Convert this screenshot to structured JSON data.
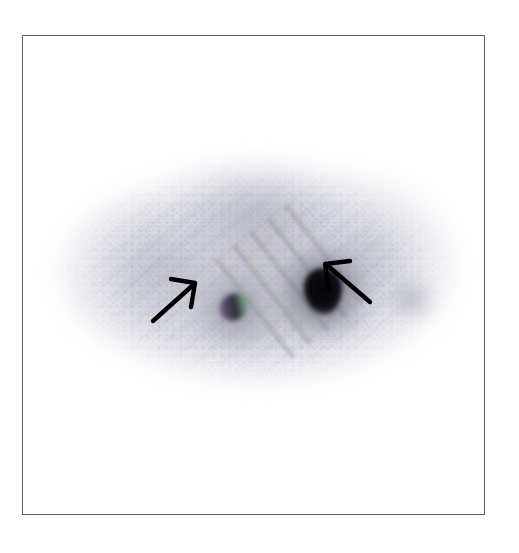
{
  "figure": {
    "domain": "medical-scintigraphy-scan",
    "modality_appearance": "grayscale planar nuclear-medicine / scintigraphic image",
    "background_color": "#ffffff",
    "frame": {
      "border_color": "#5e5e62",
      "border_width_px": 1,
      "x": 22,
      "y": 35,
      "width": 463,
      "height": 480
    },
    "caption": "",
    "title": "",
    "labels": []
  },
  "scan": {
    "field_shape": "horizontal ellipse",
    "field_bounds": {
      "x": 38,
      "y": 152,
      "width": 428,
      "height": 246
    },
    "tone_colors": {
      "background": "#ffffff",
      "faint_periphery": "#eceef3",
      "mid_uptake": "#d6d6de",
      "dense_uptake": "#bcbcc6",
      "darker_band": "#aeaeba",
      "lesion_core": "#07070b"
    },
    "texture": {
      "noise": "pixel grain",
      "striping": "diagonal acquisition stripes at about -38 degrees",
      "chromatic_fringing": "purple / green / olive diagonal bands near the centre"
    }
  },
  "findings": [
    {
      "id": "lesion-right",
      "name": "dense focal lesion (right)",
      "center": {
        "x": 300,
        "y": 255
      },
      "size_px": {
        "width": 38,
        "height": 46
      },
      "intensity": "very dark / near-black focus with graded halo",
      "annotated": true
    },
    {
      "id": "lesion-left",
      "name": "smaller focal lesion (left)",
      "center": {
        "x": 211,
        "y": 271
      },
      "size_px": {
        "width": 30,
        "height": 26
      },
      "intensity": "moderately dark focus with colour fringing",
      "annotated": true
    },
    {
      "id": "lesion-far-right",
      "name": "faint focus (far right)",
      "center": {
        "x": 388,
        "y": 263
      },
      "size_px": {
        "width": 52,
        "height": 42
      },
      "intensity": "faint low-contrast shading",
      "annotated": false
    }
  ],
  "annotations": {
    "arrow_color": "#000000",
    "arrow_line_width_px": 4,
    "arrows": [
      {
        "id": "arrow-left",
        "name": "arrow pointing to smaller left lesion",
        "tail": {
          "x": 152,
          "y": 320
        },
        "head": {
          "x": 193,
          "y": 284
        },
        "direction": "up-right",
        "points_to": "lesion-left"
      },
      {
        "id": "arrow-right",
        "name": "arrow pointing to dense right lesion",
        "tail": {
          "x": 369,
          "y": 301
        },
        "head": {
          "x": 326,
          "y": 265
        },
        "direction": "up-left",
        "points_to": "lesion-right"
      }
    ]
  }
}
